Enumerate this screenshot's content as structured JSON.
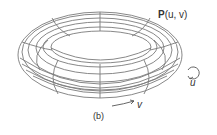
{
  "figure": {
    "point_label_bold": "P",
    "point_label_args": "(u, v)",
    "u_label": "u",
    "v_label": "v",
    "caption": "(b)"
  },
  "colors": {
    "line": "#7a7a7a",
    "text": "#333333",
    "background": "#ffffff"
  }
}
